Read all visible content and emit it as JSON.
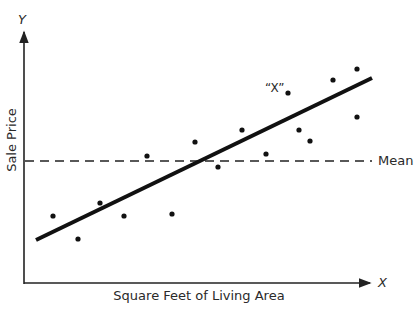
{
  "chart_data": {
    "type": "scatter",
    "title": "",
    "xlabel": "Square Feet of Living Area",
    "ylabel": "Sale Price",
    "x_axis_symbol": "X",
    "y_axis_symbol": "Y",
    "grid": false,
    "legend": null,
    "ticks": "none",
    "points_px": [
      {
        "x": 53,
        "y": 216
      },
      {
        "x": 78,
        "y": 239
      },
      {
        "x": 100,
        "y": 203
      },
      {
        "x": 124,
        "y": 216
      },
      {
        "x": 147,
        "y": 156
      },
      {
        "x": 172,
        "y": 214
      },
      {
        "x": 195,
        "y": 142
      },
      {
        "x": 218,
        "y": 167
      },
      {
        "x": 242,
        "y": 130
      },
      {
        "x": 266,
        "y": 154
      },
      {
        "x": 288,
        "y": 93,
        "label": "“X”"
      },
      {
        "x": 299,
        "y": 130
      },
      {
        "x": 310,
        "y": 141
      },
      {
        "x": 333,
        "y": 80
      },
      {
        "x": 357,
        "y": 69
      },
      {
        "x": 357,
        "y": 117
      }
    ],
    "regression_line_px": {
      "x1": 36,
      "y1": 240,
      "x2": 372,
      "y2": 78
    },
    "mean_line": {
      "label": "Mean",
      "y_px": 161,
      "style": "dashed"
    },
    "annotations": [
      {
        "text": "“X”",
        "target_point_index": 10
      }
    ]
  },
  "labels": {
    "y_symbol": "Y",
    "x_symbol": "X",
    "y_axis_title": "Sale Price",
    "x_axis_title": "Square Feet of Living Area",
    "mean": "Mean",
    "outlier": "“X”"
  }
}
